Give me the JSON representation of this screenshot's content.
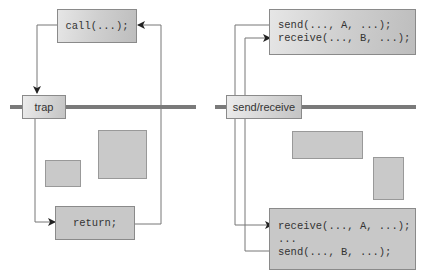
{
  "left_diagram": {
    "call_box": "call(...);",
    "boundary_label": "trap",
    "return_box": "return;"
  },
  "right_diagram": {
    "top_box": {
      "line1": "send(..., A, ...);",
      "line2": "receive(..., B, ...);"
    },
    "boundary_label": "send/receive",
    "bottom_box": {
      "line1": "receive(..., A, ...);",
      "line2": "...",
      "line3": "send(..., B, ...);"
    }
  },
  "colors": {
    "boundary_bar": "#7a7a7a",
    "box_fill": "#c8c8c8",
    "line": "#777777"
  }
}
